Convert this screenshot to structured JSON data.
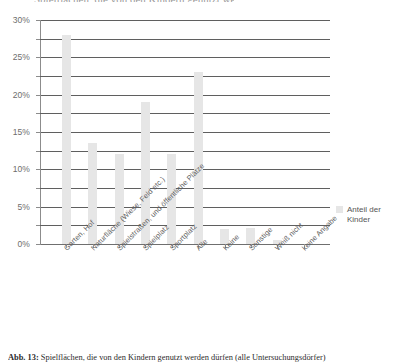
{
  "figure": {
    "caption_prefix": "Abb. 13:",
    "caption_text": "Spielflächen, die von den Kindern genutzt werden dürfen (alle Untersuchungsdörfer)",
    "top_cropped_text": "Spielflächen, die von den Kindern genutzt werden dürfen",
    "bar_color": "#e6e6e6",
    "grid_color": "#5f5f5f",
    "axis_color": "#8c8c8c",
    "text_color": "#555555"
  },
  "legend": {
    "position": "right",
    "entries": [
      {
        "label": "Anteil der Kinder",
        "color": "#e6e6e6"
      }
    ]
  },
  "chart_data": {
    "type": "bar",
    "title": "",
    "xlabel": "",
    "ylabel": "",
    "ylim": [
      0,
      30
    ],
    "ytick_values": [
      0,
      5,
      10,
      15,
      20,
      25,
      30
    ],
    "ytick_labels": [
      "0%",
      "5%",
      "10%",
      "15%",
      "20%",
      "25%",
      "30%"
    ],
    "minor_tick_step": 2.5,
    "grid": true,
    "grid_axis": "y",
    "units": "percent",
    "categories": [
      "Garten, Hof",
      "Naturfläche (Wiese, Feld etc.)",
      "Spielstraßen, und öffentliche Plätze",
      "Spielplatz",
      "Sportplatz",
      "Alle",
      "Keine",
      "Sonstige",
      "Weiß nicht",
      "keine Angabe"
    ],
    "series": [
      {
        "name": "Anteil der Kinder",
        "color": "#e6e6e6",
        "values": [
          28.0,
          13.5,
          12.0,
          19.0,
          12.0,
          23.0,
          2.0,
          2.2,
          0.5,
          0.0
        ]
      }
    ]
  }
}
